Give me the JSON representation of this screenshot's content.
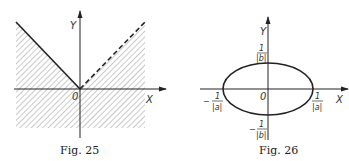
{
  "figures": [
    {
      "id": "fig25",
      "caption": "Fig. 25",
      "axis_labels": {
        "x": "X",
        "y": "Y",
        "origin": "0"
      },
      "description": "Region above-and-below shaded except wedge y > |x|; boundary y = -x (x<0) solid, y = x (x>0) dashed",
      "boundary": {
        "left_branch": "solid",
        "right_branch": "dashed"
      }
    },
    {
      "id": "fig26",
      "caption": "Fig. 26",
      "axis_labels": {
        "x": "X",
        "y": "Y",
        "origin": "0"
      },
      "description": "Ellipse centered at origin",
      "intercepts": {
        "x_pos": {
          "num": "1",
          "den": "|a|",
          "sign": ""
        },
        "x_neg": {
          "num": "1",
          "den": "|a|",
          "sign": "−"
        },
        "y_pos": {
          "num": "1",
          "den": "|b|",
          "sign": ""
        },
        "y_neg": {
          "num": "1",
          "den": "|b|",
          "sign": "−"
        }
      }
    }
  ]
}
